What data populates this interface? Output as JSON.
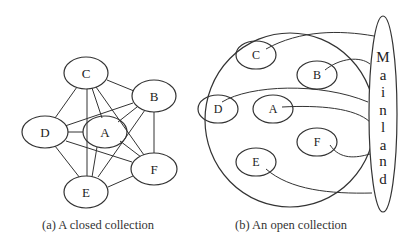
{
  "figure_a": {
    "caption": "(a) A closed collection",
    "nodes": [
      {
        "id": "C",
        "label": "C"
      },
      {
        "id": "B",
        "label": "B"
      },
      {
        "id": "D",
        "label": "D"
      },
      {
        "id": "A",
        "label": "A"
      },
      {
        "id": "F",
        "label": "F"
      },
      {
        "id": "E",
        "label": "E"
      }
    ],
    "edges": [
      [
        "C",
        "B"
      ],
      [
        "C",
        "D"
      ],
      [
        "C",
        "E"
      ],
      [
        "C",
        "A"
      ],
      [
        "C",
        "F"
      ],
      [
        "B",
        "D"
      ],
      [
        "B",
        "A"
      ],
      [
        "B",
        "E"
      ],
      [
        "B",
        "F"
      ],
      [
        "D",
        "A"
      ],
      [
        "D",
        "E"
      ],
      [
        "D",
        "F"
      ],
      [
        "A",
        "E"
      ],
      [
        "A",
        "F"
      ],
      [
        "E",
        "F"
      ]
    ]
  },
  "figure_b": {
    "caption": "(b) An open collection",
    "nodes": [
      {
        "id": "C",
        "label": "C"
      },
      {
        "id": "B",
        "label": "B"
      },
      {
        "id": "D",
        "label": "D"
      },
      {
        "id": "A",
        "label": "A"
      },
      {
        "id": "F",
        "label": "F"
      },
      {
        "id": "E",
        "label": "E"
      }
    ],
    "mainland": {
      "label": "Mainland",
      "letters": [
        "M",
        "a",
        "i",
        "n",
        "l",
        "a",
        "n",
        "d"
      ]
    },
    "edges_to_mainland": [
      "C",
      "B",
      "D",
      "A",
      "F",
      "E"
    ]
  }
}
